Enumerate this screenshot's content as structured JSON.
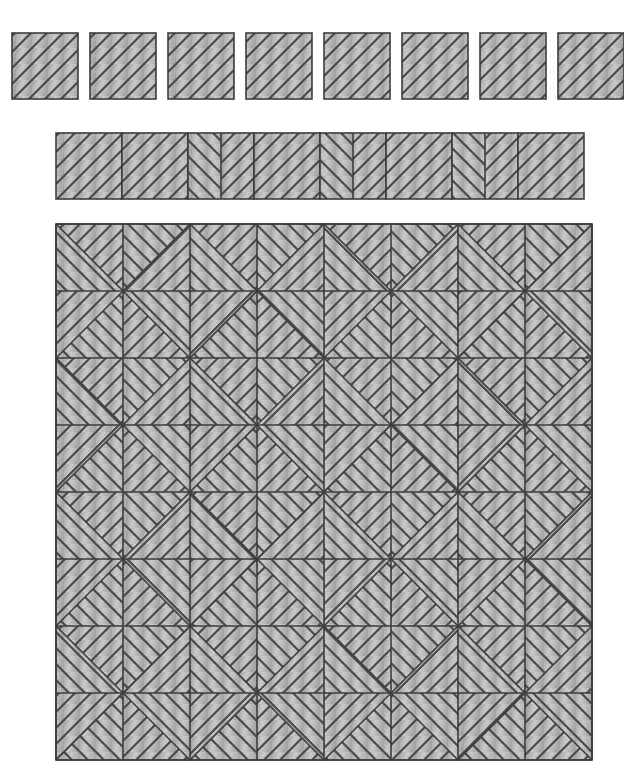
{
  "figure": {
    "background_color": "#ffffff",
    "fill_color": "#b6b6b6",
    "fill_light": "#c9c9c9",
    "fill_dark": "#a6a6a6",
    "hatch_color": "#4a4a4a",
    "outline_color": "#3c3c3c",
    "hatch_spacing": 16,
    "hatch_width": 2.2,
    "outline_width": 1.6
  },
  "sections": [
    {
      "name": "isolated-tile-row",
      "label": "Row of separated hatched squares",
      "count": 8,
      "x": 12,
      "y": 33,
      "cell": 66,
      "gap": 12,
      "pitch": 78,
      "clip_right": 624,
      "tiles": [
        {
          "index": 0,
          "hatch": "slash"
        },
        {
          "index": 1,
          "hatch": "slash"
        },
        {
          "index": 2,
          "hatch": "slash"
        },
        {
          "index": 3,
          "hatch": "slash"
        },
        {
          "index": 4,
          "hatch": "slash"
        },
        {
          "index": 5,
          "hatch": "slash"
        },
        {
          "index": 6,
          "hatch": "slash"
        },
        {
          "index": 7,
          "hatch": "slash"
        }
      ]
    },
    {
      "name": "contiguous-tile-strip",
      "label": "Contiguous strip of mirrored hatched squares",
      "count": 8,
      "x": 56,
      "y": 133,
      "cell": 66,
      "pitch": 66,
      "tiles": [
        {
          "index": 0,
          "mode": "plain",
          "hatch": "slash"
        },
        {
          "index": 1,
          "mode": "plain",
          "hatch": "slash"
        },
        {
          "index": 2,
          "mode": "split-v",
          "left": "backslash",
          "right": "slash"
        },
        {
          "index": 3,
          "mode": "plain",
          "hatch": "slash"
        },
        {
          "index": 4,
          "mode": "split-v",
          "left": "backslash",
          "right": "slash"
        },
        {
          "index": 5,
          "mode": "plain",
          "hatch": "slash"
        },
        {
          "index": 6,
          "mode": "split-v",
          "left": "backslash",
          "right": "slash"
        },
        {
          "index": 7,
          "mode": "plain",
          "hatch": "slash"
        }
      ]
    },
    {
      "name": "main-tile-grid",
      "label": "8 by 8 grid of diagonally split hatched tiles forming diamond motifs",
      "cols": 8,
      "rows": 8,
      "x": 56,
      "y": 224,
      "cell": 67,
      "width": 536,
      "height": 536,
      "motif": "diamond-pinwheel",
      "split_rule": "each cell is divided by one diagonal into two triangles with mirrored hatch directions; direction flips with (row+col) parity"
    }
  ]
}
